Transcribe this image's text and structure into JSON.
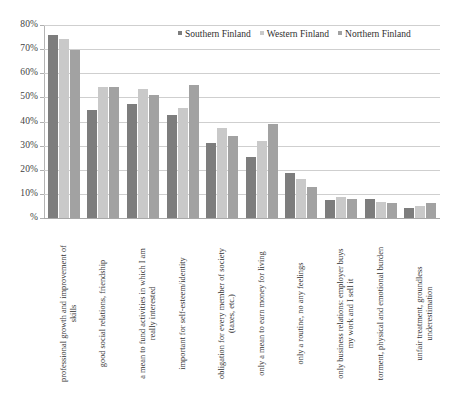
{
  "chart_data": {
    "type": "bar",
    "title": "",
    "subtitle": "",
    "xlabel": "",
    "ylabel": "",
    "ylim": [
      0,
      80
    ],
    "grid": true,
    "legend_position": "top-right",
    "y_ticks": [
      "%",
      "10%",
      "20%",
      "30%",
      "40%",
      "50%",
      "60%",
      "70%",
      "80%"
    ],
    "y_tick_values": [
      0,
      10,
      20,
      30,
      40,
      50,
      60,
      70,
      80
    ],
    "categories": [
      "professional growth and improvement of skills",
      "good social relations, friendship",
      "a mean to fund activities in which I am really interested",
      "important for self-esteem/identity",
      "obligation for every member of society (taxes, etc.)",
      "only a mean to earn money for living",
      "only a routine, no any feelings",
      "only business relations: employer buys my work and I sell it",
      "torment, physical and emotional burden",
      "unfair treatment, groundless underestimation"
    ],
    "category_lines": [
      [
        "professional growth and improvement of",
        "skills"
      ],
      [
        "good social relations, friendship",
        ""
      ],
      [
        "a mean to fund activities in which I am",
        "really interested"
      ],
      [
        "important for self-esteem/identity",
        ""
      ],
      [
        "obligation for every member of society",
        "(taxes, etc.)"
      ],
      [
        "only a mean to earn money for living",
        ""
      ],
      [
        "only a routine, no any feelings",
        ""
      ],
      [
        "only business relations: employer buys",
        "my work and I sell it"
      ],
      [
        "torment, physical and emotional burden",
        ""
      ],
      [
        "unfair treatment, groundless",
        "underestimation"
      ]
    ],
    "series": [
      {
        "name": "Southern Finland",
        "color": "#7d7d7d",
        "values": [
          76.0,
          44.8,
          47.2,
          42.7,
          31.2,
          25.3,
          18.7,
          7.3,
          7.7,
          4.1
        ]
      },
      {
        "name": "Western Finland",
        "color": "#c9c9c9",
        "values": [
          74.0,
          54.5,
          53.3,
          45.4,
          37.3,
          31.8,
          16.2,
          8.6,
          6.7,
          4.8
        ]
      },
      {
        "name": "Northern Finland",
        "color": "#a2a2a2",
        "values": [
          69.5,
          54.5,
          51.1,
          55.0,
          34.2,
          38.8,
          12.7,
          7.7,
          6.2,
          6.2
        ]
      }
    ]
  },
  "legend": {
    "items": [
      {
        "label": "Southern Finland"
      },
      {
        "label": "Western Finland"
      },
      {
        "label": "Northern Finland"
      }
    ]
  }
}
